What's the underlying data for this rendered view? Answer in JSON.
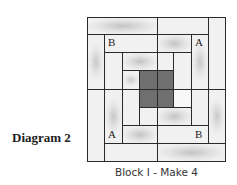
{
  "diagram": {
    "label": "Diagram 2",
    "caption": "Block I - Make 4",
    "type": "log-cabin quilt block",
    "colors": {
      "line": "#2a2a2a",
      "light_fabric": "#efefef",
      "shaded_fabric": "#c4c4c4",
      "center_fabric": "#6f6f6f"
    },
    "letters": [
      {
        "text": "B",
        "position": "ring2-top-left"
      },
      {
        "text": "A",
        "position": "ring2-right-top"
      },
      {
        "text": "A",
        "position": "ring2-left-bottom"
      },
      {
        "text": "B",
        "position": "ring2-bottom-right"
      }
    ]
  }
}
